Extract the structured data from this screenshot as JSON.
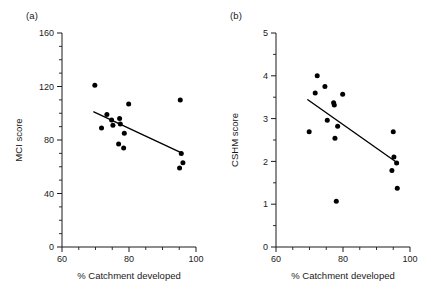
{
  "figure": {
    "background": "#ffffff",
    "ink": "#1a1a1a",
    "marker_color": "#000000"
  },
  "panels": [
    {
      "key": "a",
      "label": "(a)",
      "xlabel": "% Catchment developed",
      "ylabel": "MCI score"
    },
    {
      "key": "b",
      "label": "(b)",
      "xlabel": "% Catchment developed",
      "ylabel": "CSHM score"
    }
  ],
  "chart_data": [
    {
      "type": "scatter",
      "panel": "(a)",
      "title": "",
      "xlabel": "% Catchment developed",
      "ylabel": "MCI score",
      "xlim": [
        60,
        100
      ],
      "ylim": [
        0,
        160
      ],
      "xticks": [
        60,
        80,
        100
      ],
      "xtick_labels": [
        "60",
        "80",
        "100"
      ],
      "xminor_step": 5,
      "yticks": [
        0,
        40,
        80,
        120,
        160
      ],
      "ytick_labels": [
        "0",
        "40",
        "80",
        "120",
        "160"
      ],
      "yminor_step": 10,
      "grid": false,
      "legend": "none",
      "points": [
        {
          "x": 69.8,
          "y": 121
        },
        {
          "x": 71.8,
          "y": 89
        },
        {
          "x": 73.4,
          "y": 99
        },
        {
          "x": 74.8,
          "y": 95
        },
        {
          "x": 75.2,
          "y": 91
        },
        {
          "x": 77.2,
          "y": 96
        },
        {
          "x": 77.4,
          "y": 92
        },
        {
          "x": 76.9,
          "y": 77
        },
        {
          "x": 78.4,
          "y": 74
        },
        {
          "x": 78.6,
          "y": 85
        },
        {
          "x": 79.9,
          "y": 107
        },
        {
          "x": 95.3,
          "y": 110
        },
        {
          "x": 95.6,
          "y": 70
        },
        {
          "x": 95.1,
          "y": 59
        },
        {
          "x": 96.1,
          "y": 63
        }
      ],
      "fit_line": {
        "x": [
          69.5,
          96.0
        ],
        "y": [
          101.0,
          70.0
        ],
        "style": "solid"
      }
    },
    {
      "type": "scatter",
      "panel": "(b)",
      "title": "",
      "xlabel": "% Catchment developed",
      "ylabel": "CSHM score",
      "xlim": [
        60,
        100
      ],
      "ylim": [
        0,
        5
      ],
      "xticks": [
        60,
        80,
        100
      ],
      "xtick_labels": [
        "60",
        "80",
        "100"
      ],
      "xminor_step": 5,
      "yticks": [
        0,
        1,
        2,
        3,
        4,
        5
      ],
      "ytick_labels": [
        "0",
        "1",
        "2",
        "3",
        "4",
        "5"
      ],
      "yminor_step": 0.5,
      "grid": false,
      "legend": "none",
      "points": [
        {
          "x": 69.9,
          "y": 2.69
        },
        {
          "x": 71.7,
          "y": 3.6
        },
        {
          "x": 72.3,
          "y": 4.0
        },
        {
          "x": 74.6,
          "y": 3.75
        },
        {
          "x": 75.3,
          "y": 2.96
        },
        {
          "x": 77.2,
          "y": 3.37
        },
        {
          "x": 77.4,
          "y": 3.32
        },
        {
          "x": 77.6,
          "y": 2.54
        },
        {
          "x": 78.0,
          "y": 1.07
        },
        {
          "x": 78.4,
          "y": 2.82
        },
        {
          "x": 79.9,
          "y": 3.57
        },
        {
          "x": 95.0,
          "y": 2.69
        },
        {
          "x": 95.2,
          "y": 2.1
        },
        {
          "x": 94.6,
          "y": 1.79
        },
        {
          "x": 96.0,
          "y": 1.96
        },
        {
          "x": 96.2,
          "y": 1.37
        }
      ],
      "fit_line": {
        "x": [
          69.5,
          96.5
        ],
        "y": [
          3.44,
          1.95
        ],
        "style": "solid"
      }
    }
  ]
}
